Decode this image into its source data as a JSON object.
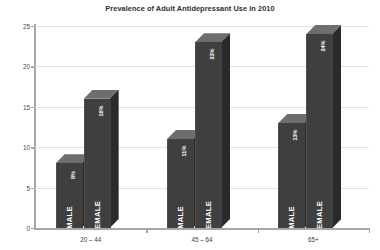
{
  "chart_data": {
    "type": "bar",
    "title": "Prevalence of Adult Antidepressant Use in 2010",
    "xlabel": "",
    "ylabel": "",
    "ylim": [
      0,
      25
    ],
    "yticks": [
      0,
      5,
      10,
      15,
      20,
      25
    ],
    "grid": true,
    "legend": "none",
    "style": "3d-clustered-column",
    "categories": [
      "20 – 44",
      "45 – 64",
      "65+"
    ],
    "series": [
      {
        "name": "MALE",
        "values": [
          8,
          11,
          13
        ],
        "data_labels": [
          "8%",
          "11%",
          "13%"
        ]
      },
      {
        "name": "FEMALE",
        "values": [
          16,
          23,
          24
        ],
        "data_labels": [
          "16%",
          "23%",
          "24%"
        ]
      }
    ],
    "colors": {
      "bar_front": "#3f3f3f",
      "bar_top": "#6e6e6e",
      "bar_side": "#2a2a2a",
      "gridline": "#e2e2e2",
      "axis": "#a6a6a6",
      "background": "#ffffff",
      "title_text": "#2f2f2f",
      "label_text": "#ffffff"
    },
    "bars": [
      {
        "group": "20 – 44",
        "series": "MALE",
        "value": 8,
        "label": "8%",
        "series_label": "MALE"
      },
      {
        "group": "20 – 44",
        "series": "FEMALE",
        "value": 16,
        "label": "16%",
        "series_label": "FEMALE"
      },
      {
        "group": "45 – 64",
        "series": "MALE",
        "value": 11,
        "label": "11%",
        "series_label": "MALE"
      },
      {
        "group": "45 – 64",
        "series": "FEMALE",
        "value": 23,
        "label": "23%",
        "series_label": "FEMALE"
      },
      {
        "group": "65+",
        "series": "MALE",
        "value": 13,
        "label": "13%",
        "series_label": "MALE"
      },
      {
        "group": "65+",
        "series": "FEMALE",
        "value": 24,
        "label": "24%",
        "series_label": "FEMALE"
      }
    ]
  },
  "axis": {
    "y_tick_labels": [
      "25",
      "20",
      "15",
      "10",
      "5",
      "0"
    ],
    "x_tick_labels": [
      "20 – 44",
      "45 – 64",
      "65+"
    ]
  }
}
